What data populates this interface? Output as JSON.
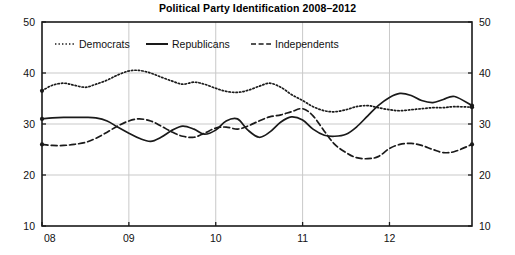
{
  "chart_data": {
    "type": "line",
    "title": "Political Party Identification 2008–2012",
    "xlabel": "",
    "ylabel": "",
    "ylim": [
      10,
      50
    ],
    "yticks": [
      10,
      20,
      30,
      40,
      50
    ],
    "ytick_labels_left": [
      "10",
      "20",
      "30",
      "40",
      "50"
    ],
    "ytick_labels_right": [
      "10",
      "20",
      "30",
      "40",
      "50"
    ],
    "xlim": [
      2008.0,
      2012.95
    ],
    "xticks": [
      2008,
      2009,
      2010,
      2011,
      2012
    ],
    "xtick_labels": [
      "08",
      "09",
      "10",
      "11",
      "12"
    ],
    "grid": "both-light-gray",
    "legend_position": "top-left-inside",
    "series": [
      {
        "name": "Democrats",
        "style": "dotted",
        "color": "#1a1a1a",
        "x": [
          2008.0,
          2008.12,
          2008.25,
          2008.37,
          2008.5,
          2008.62,
          2008.75,
          2008.87,
          2009.0,
          2009.12,
          2009.25,
          2009.37,
          2009.5,
          2009.62,
          2009.75,
          2009.87,
          2010.0,
          2010.12,
          2010.25,
          2010.37,
          2010.5,
          2010.62,
          2010.75,
          2010.87,
          2011.0,
          2011.12,
          2011.25,
          2011.37,
          2011.5,
          2011.62,
          2011.75,
          2011.87,
          2012.0,
          2012.12,
          2012.25,
          2012.37,
          2012.5,
          2012.62,
          2012.75,
          2012.95
        ],
        "values": [
          36.5,
          37.6,
          38.0,
          37.6,
          37.2,
          37.8,
          38.6,
          39.6,
          40.4,
          40.5,
          40.0,
          39.2,
          38.4,
          37.8,
          38.2,
          37.8,
          37.0,
          36.4,
          36.2,
          36.6,
          37.4,
          38.0,
          37.2,
          35.8,
          34.6,
          33.4,
          32.6,
          32.4,
          32.8,
          33.4,
          33.6,
          33.2,
          32.8,
          32.6,
          32.8,
          33.0,
          33.2,
          33.2,
          33.4,
          33.3
        ]
      },
      {
        "name": "Republicans",
        "style": "solid",
        "color": "#1a1a1a",
        "x": [
          2008.0,
          2008.12,
          2008.25,
          2008.37,
          2008.5,
          2008.62,
          2008.75,
          2008.87,
          2009.0,
          2009.12,
          2009.25,
          2009.37,
          2009.5,
          2009.62,
          2009.75,
          2009.87,
          2010.0,
          2010.12,
          2010.25,
          2010.37,
          2010.5,
          2010.62,
          2010.75,
          2010.87,
          2011.0,
          2011.12,
          2011.25,
          2011.37,
          2011.5,
          2011.62,
          2011.75,
          2011.87,
          2012.0,
          2012.12,
          2012.25,
          2012.37,
          2012.5,
          2012.62,
          2012.75,
          2012.95
        ],
        "values": [
          31.0,
          31.2,
          31.3,
          31.3,
          31.3,
          31.2,
          30.6,
          29.4,
          28.2,
          27.2,
          26.6,
          27.4,
          28.8,
          29.6,
          29.0,
          28.0,
          28.8,
          30.6,
          31.0,
          28.8,
          27.4,
          28.4,
          30.4,
          31.4,
          30.8,
          29.0,
          27.8,
          27.6,
          28.0,
          29.4,
          31.6,
          33.6,
          35.2,
          36.0,
          35.6,
          34.6,
          34.2,
          34.8,
          35.4,
          33.6
        ]
      },
      {
        "name": "Independents",
        "style": "dashed",
        "color": "#1a1a1a",
        "x": [
          2008.0,
          2008.12,
          2008.25,
          2008.37,
          2008.5,
          2008.62,
          2008.75,
          2008.87,
          2009.0,
          2009.12,
          2009.25,
          2009.37,
          2009.5,
          2009.62,
          2009.75,
          2009.87,
          2010.0,
          2010.12,
          2010.25,
          2010.37,
          2010.5,
          2010.62,
          2010.75,
          2010.87,
          2011.0,
          2011.12,
          2011.25,
          2011.37,
          2011.5,
          2011.62,
          2011.75,
          2011.87,
          2012.0,
          2012.12,
          2012.25,
          2012.37,
          2012.5,
          2012.62,
          2012.75,
          2012.95
        ],
        "values": [
          26.0,
          25.8,
          25.8,
          26.0,
          26.4,
          27.2,
          28.4,
          29.6,
          30.6,
          31.0,
          30.6,
          29.6,
          28.4,
          27.6,
          27.4,
          28.2,
          29.2,
          29.4,
          29.0,
          29.6,
          30.6,
          31.4,
          31.8,
          32.4,
          33.0,
          31.6,
          28.6,
          26.0,
          24.4,
          23.4,
          23.2,
          23.6,
          25.2,
          26.0,
          26.2,
          25.8,
          25.0,
          24.4,
          24.6,
          26.0
        ]
      }
    ]
  },
  "legend": {
    "items": [
      {
        "label": "Democrats",
        "style": "dotted"
      },
      {
        "label": "Republicans",
        "style": "solid"
      },
      {
        "label": "Independents",
        "style": "dashed"
      }
    ]
  }
}
